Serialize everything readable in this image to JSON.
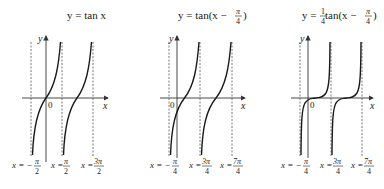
{
  "panels": [
    {
      "title_prefix": "y = tan x",
      "axis_y": "y",
      "axis_x": "x",
      "origin": "0",
      "asymptotes": [
        {
          "label_lhs": "x = −",
          "num": "π",
          "den": "2"
        },
        {
          "label_lhs": "x = ",
          "num": "π",
          "den": "2"
        },
        {
          "label_lhs": "x = ",
          "num": "3π",
          "den": "2"
        }
      ]
    },
    {
      "title_prefix": "y = tan(x − ",
      "title_num": "π",
      "title_den": "4",
      "title_suffix": ")",
      "axis_y": "y",
      "axis_x": "x",
      "origin": "0",
      "asymptotes": [
        {
          "label_lhs": "x = −",
          "num": "π",
          "den": "4"
        },
        {
          "label_lhs": "x = ",
          "num": "3π",
          "den": "4"
        },
        {
          "label_lhs": "x = ",
          "num": "7π",
          "den": "4"
        }
      ]
    },
    {
      "title_prefix": "y = ",
      "title_coef_num": "1",
      "title_coef_den": "4",
      "title_mid": " tan(x − ",
      "title_num": "π",
      "title_den": "4",
      "title_suffix": ")",
      "axis_y": "y",
      "axis_x": "x",
      "origin": "0",
      "asymptotes": [
        {
          "label_lhs": "x = −",
          "num": "π",
          "den": "4"
        },
        {
          "label_lhs": "x = ",
          "num": "3π",
          "den": "4"
        },
        {
          "label_lhs": "x = ",
          "num": "7π",
          "den": "4"
        }
      ]
    }
  ],
  "colors": {
    "curve": "#1a1a1a",
    "axis": "#333333",
    "asymptote": "#555555"
  }
}
